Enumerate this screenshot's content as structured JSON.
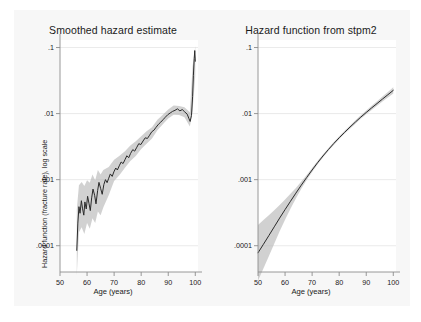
{
  "figure": {
    "background_color": "#f7f7f7",
    "panel_background_color": "#ffffff",
    "line_color": "#2a2a2a",
    "band_color": "#b5b5b5"
  },
  "panels": [
    {
      "id": "smoothed-hazard-estimate",
      "title": "Smoothed hazard estimate",
      "xlabel": "Age (years)",
      "ylabel": "Hazard function (fracture rate), log scale"
    },
    {
      "id": "hazard-function-stpm2",
      "title": "Hazard function from stpm2",
      "xlabel": "Age (years)",
      "ylabel": "Hazard function (fracture rate), log scale"
    }
  ],
  "axes": {
    "x_ticks": [
      "50",
      "60",
      "70",
      "80",
      "90",
      "100"
    ],
    "x_tick_values": [
      50,
      60,
      70,
      80,
      90,
      100
    ],
    "y_ticks": [
      ".1",
      ".01",
      ".001",
      ".0001"
    ],
    "y_tick_values": [
      0.1,
      0.01,
      0.001,
      0.0001
    ]
  },
  "chart_data": [
    {
      "type": "line",
      "title": "Smoothed hazard estimate",
      "xlabel": "Age (years)",
      "ylabel": "Hazard function (fracture rate), log scale",
      "xlim": [
        50,
        101
      ],
      "ylim": [
        4e-05,
        0.13
      ],
      "yscale": "log",
      "grid": true,
      "legend": "none",
      "series": [
        {
          "name": "Smoothed hazard",
          "x": [
            56.2,
            56.6,
            57.0,
            57.4,
            57.9,
            58.3,
            58.8,
            59.2,
            59.7,
            60.2,
            60.7,
            61.2,
            61.7,
            62.2,
            62.8,
            63.3,
            63.9,
            64.4,
            65.0,
            65.6,
            66.2,
            66.8,
            67.4,
            68.0,
            68.6,
            69.3,
            69.9,
            70.6,
            71.2,
            71.9,
            72.6,
            73.3,
            74.0,
            74.7,
            75.4,
            76.1,
            76.9,
            77.6,
            78.4,
            79.1,
            79.9,
            80.7,
            81.5,
            82.3,
            83.1,
            83.9,
            84.7,
            85.5,
            86.4,
            87.2,
            88.1,
            88.9,
            89.8,
            90.7,
            91.6,
            92.5,
            93.4,
            94.3,
            95.2,
            96.1,
            97.0,
            97.6,
            98.1,
            98.6,
            99.0,
            99.3,
            99.6,
            99.8,
            100.0
          ],
          "y": [
            8.5e-05,
            0.00022,
            0.00039,
            0.00031,
            0.00048,
            0.00037,
            0.00029,
            0.00046,
            0.00036,
            0.00056,
            0.00044,
            0.00034,
            0.00053,
            0.00072,
            0.00058,
            0.00043,
            0.00068,
            0.00091,
            0.00074,
            0.0006,
            0.00084,
            0.001,
            0.0009,
            0.00105,
            0.00122,
            0.00112,
            0.00131,
            0.0015,
            0.0014,
            0.00162,
            0.00185,
            0.00175,
            0.002,
            0.0023,
            0.00215,
            0.0025,
            0.00285,
            0.0027,
            0.0031,
            0.0035,
            0.0034,
            0.00385,
            0.0043,
            0.0042,
            0.0047,
            0.0053,
            0.0056,
            0.0062,
            0.0069,
            0.0074,
            0.0081,
            0.0088,
            0.0096,
            0.0102,
            0.0108,
            0.0112,
            0.0118,
            0.011,
            0.0115,
            0.0106,
            0.0098,
            0.0085,
            0.0076,
            0.0094,
            0.018,
            0.038,
            0.068,
            0.09,
            0.062
          ]
        },
        {
          "name": "95% CI upper",
          "x": [
            56.2,
            57.0,
            58.0,
            59.0,
            60.0,
            61.0,
            62.0,
            63.0,
            64.0,
            65.0,
            66.0,
            68.0,
            70.0,
            72.0,
            74.0,
            76.0,
            78.0,
            80.0,
            82.0,
            84.0,
            86.0,
            88.0,
            90.0,
            92.0,
            94.0,
            96.0,
            98.0,
            99.0,
            100.0
          ],
          "y": [
            0.00035,
            0.00082,
            0.00092,
            0.0008,
            0.00098,
            0.0009,
            0.0012,
            0.00098,
            0.0014,
            0.0012,
            0.0014,
            0.00155,
            0.002,
            0.0023,
            0.0027,
            0.0033,
            0.0038,
            0.00455,
            0.0054,
            0.0062,
            0.0081,
            0.0096,
            0.0115,
            0.0132,
            0.013,
            0.0125,
            0.0105,
            0.052,
            0.105
          ]
        },
        {
          "name": "95% CI lower",
          "x": [
            56.2,
            57.0,
            58.0,
            59.0,
            60.0,
            61.0,
            62.0,
            63.0,
            64.0,
            65.0,
            66.0,
            68.0,
            70.0,
            72.0,
            74.0,
            76.0,
            78.0,
            80.0,
            82.0,
            84.0,
            86.0,
            88.0,
            90.0,
            92.0,
            94.0,
            96.0,
            98.0,
            99.0,
            100.0
          ],
          "y": [
            3.5e-05,
            0.00016,
            0.00019,
            0.00015,
            0.00022,
            0.00018,
            0.00026,
            0.00022,
            0.00033,
            0.00029,
            0.00038,
            0.00058,
            0.00095,
            0.00118,
            0.00152,
            0.00192,
            0.00228,
            0.0029,
            0.0035,
            0.0042,
            0.0056,
            0.0069,
            0.0084,
            0.0096,
            0.0095,
            0.0088,
            0.0064,
            0.011,
            0.038
          ]
        }
      ]
    },
    {
      "type": "line",
      "title": "Hazard function from stpm2",
      "xlabel": "Age (years)",
      "ylabel": "Hazard function (fracture rate), log scale",
      "xlim": [
        50,
        101
      ],
      "ylim": [
        4e-05,
        0.13
      ],
      "yscale": "log",
      "grid": true,
      "legend": "none",
      "series": [
        {
          "name": "Model hazard (stpm2)",
          "x": [
            50,
            52,
            54,
            56,
            58,
            60,
            62,
            64,
            66,
            68,
            70,
            72,
            74,
            76,
            78,
            80,
            82,
            84,
            86,
            88,
            90,
            92,
            94,
            96,
            98,
            100
          ],
          "y": [
            7.8e-05,
            0.000105,
            0.000142,
            0.000193,
            0.000262,
            0.000352,
            0.00047,
            0.000625,
            0.000825,
            0.00108,
            0.0014,
            0.0018,
            0.00228,
            0.00285,
            0.00352,
            0.0043,
            0.0052,
            0.00625,
            0.00745,
            0.00885,
            0.0104,
            0.0122,
            0.0142,
            0.0166,
            0.0193,
            0.0225
          ]
        },
        {
          "name": "95% CI upper",
          "x": [
            50,
            52,
            54,
            56,
            58,
            60,
            62,
            64,
            66,
            68,
            70,
            72,
            74,
            76,
            78,
            80,
            82,
            84,
            86,
            88,
            90,
            92,
            94,
            96,
            98,
            100
          ],
          "y": [
            0.000205,
            0.000245,
            0.00029,
            0.000345,
            0.000415,
            0.0005,
            0.00061,
            0.00075,
            0.000935,
            0.00118,
            0.0015,
            0.00191,
            0.00241,
            0.003,
            0.0037,
            0.00452,
            0.00548,
            0.0066,
            0.0079,
            0.0094,
            0.0111,
            0.0131,
            0.0154,
            0.0181,
            0.0213,
            0.0251
          ]
        },
        {
          "name": "95% CI lower",
          "x": [
            50,
            52,
            54,
            56,
            58,
            60,
            62,
            64,
            66,
            68,
            70,
            72,
            74,
            76,
            78,
            80,
            82,
            84,
            86,
            88,
            90,
            92,
            94,
            96,
            98,
            100
          ],
          "y": [
            2.95e-05,
            4.5e-05,
            6.9e-05,
            0.000107,
            0.000165,
            0.000248,
            0.000362,
            0.00052,
            0.00073,
            0.00099,
            0.00131,
            0.0017,
            0.00216,
            0.00271,
            0.00335,
            0.0041,
            0.00494,
            0.00592,
            0.00703,
            0.00833,
            0.00975,
            0.01135,
            0.0131,
            0.0152,
            0.0175,
            0.0202
          ]
        }
      ]
    }
  ]
}
